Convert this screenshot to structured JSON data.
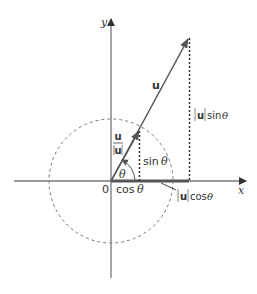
{
  "diagram": {
    "axes": {
      "x_label": "x",
      "y_label": "y",
      "origin_label": "0"
    },
    "vector": {
      "name": "u",
      "unit_vector_num": "u",
      "unit_vector_den": "u"
    },
    "angle_label": "θ",
    "labels": {
      "sin": "sin",
      "cos": "cos",
      "theta": "θ",
      "u_sin_u": "u",
      "u_sin_fn": "sin",
      "u_cos_u": "u",
      "u_cos_fn": "cos"
    },
    "colors": {
      "axis": "#777777",
      "vector": "#555555",
      "dashed_circle": "#777777",
      "dotted": "#333333",
      "projection": "#555555"
    }
  }
}
